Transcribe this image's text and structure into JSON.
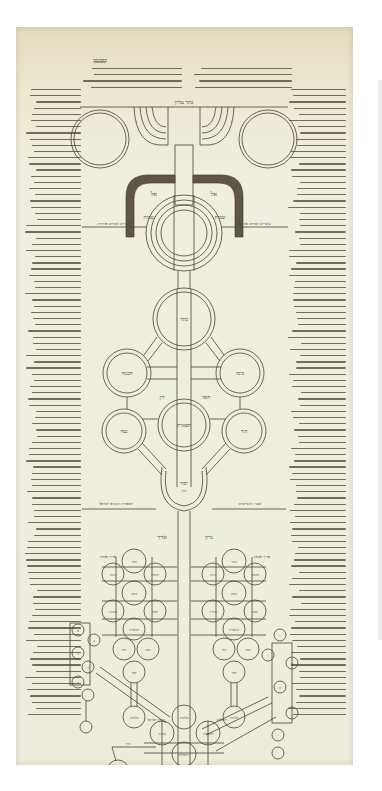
{
  "document": {
    "type": "manuscript-scroll",
    "description": "Kabbalistic tree-of-sefirot diagram on parchment with Hebrew margin commentary",
    "colors": {
      "background": "#ffffff",
      "parchment": "#eeeddd",
      "parchment_top": "#e3dcbf",
      "ink": "#3a3428",
      "arch_band": "#5e5648"
    }
  },
  "header": {
    "title_line": "הקדמה",
    "top_label": "כתר עליון"
  },
  "upper_diagram": {
    "arch_labels": {
      "left": "אל",
      "right": "אל"
    },
    "side_labels": {
      "left": "שמות",
      "right": "שמות"
    },
    "bar_labels": {
      "left": "עשרים ושתים אותיות",
      "right": "עשרים ושתים אותיות"
    },
    "upper_sefirot": [
      {
        "id": "keter",
        "label": "כתר"
      },
      {
        "id": "chokhmah",
        "label": "חכמה"
      },
      {
        "id": "binah",
        "label": "בינה"
      },
      {
        "id": "chesed",
        "label": "חסד"
      },
      {
        "id": "gevurah",
        "label": "גבורה"
      },
      {
        "id": "tiferet",
        "label": "תפארת"
      },
      {
        "id": "netzach",
        "label": "נצח"
      },
      {
        "id": "hod",
        "label": "הוד"
      },
      {
        "id": "yesod",
        "label": "יסוד"
      }
    ],
    "inner_labels": {
      "left_branch": "דין",
      "right_branch": "חסד",
      "yesod_sub": "ח״ן"
    },
    "side_note_left": "תפארת הנקרא ישראל",
    "side_note_right": "שער החמישים"
  },
  "trunk_labels": {
    "left": "ארך",
    "right": "גרון"
  },
  "lower_diagram": {
    "left_tree_title": "אריך אנפין",
    "right_tree_title": "אריך אנפין",
    "left_tree": [
      "כתר",
      "בינה",
      "חכמה",
      "דעת",
      "גבורה",
      "חסד",
      "תפארת",
      "הוד",
      "נצח",
      "יסוד",
      "מלכות"
    ],
    "right_tree": [
      "כתר",
      "בינה",
      "חכמה",
      "דעת",
      "גבורה",
      "חסד",
      "תפארת",
      "הוד",
      "נצח",
      "יסוד",
      "מלכות"
    ],
    "bottom_tree": [
      "מלכות",
      "גבורה",
      "תפארת",
      "ירושלים",
      "ציון"
    ],
    "bottom_labels": {
      "left": "כנסת ישראל",
      "right": "ירושלים",
      "lower_left": "ציון"
    },
    "letter_circles": [
      "א",
      "ב",
      "ג",
      "ד",
      "ה",
      "ו",
      "ז",
      "ח",
      "ט",
      "י"
    ]
  }
}
